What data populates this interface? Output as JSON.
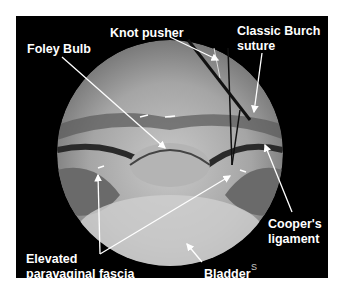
{
  "figure": {
    "labels": {
      "knot_pusher": "Knot pusher",
      "foley_bulb": "Foley Bulb",
      "classic_burch_1": "Classic Burch",
      "classic_burch_2": "suture",
      "coopers_1": "Cooper's",
      "coopers_2": "ligament",
      "elevated_1": "Elevated",
      "elevated_2": "paravaginal fascia",
      "bladder": "Bladder",
      "signature": "S"
    },
    "colors": {
      "background": "#000000",
      "text": "#ffffff",
      "page": "#ffffff"
    }
  }
}
